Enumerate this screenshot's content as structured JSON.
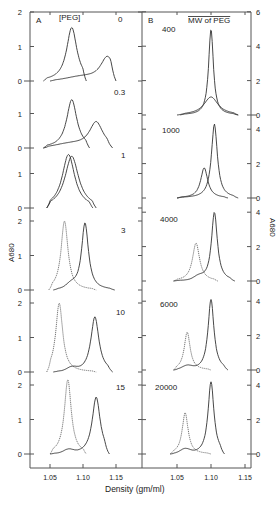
{
  "figure": {
    "xlabel": "Density (gm/ml)",
    "ylabel_left": "A680",
    "ylabel_right": "A680",
    "panel_A": {
      "letter": "A",
      "header": "[PEG]"
    },
    "panel_B": {
      "letter": "B",
      "header": "MW of PEG"
    }
  },
  "chart_data": [
    {
      "type": "line",
      "title": "A  [PEG]",
      "xlabel": "Density (gm/ml)",
      "ylabel": "A680",
      "x_ticks": [
        "1.05",
        "1.10",
        "1.15"
      ],
      "xlim": [
        1.02,
        1.17
      ],
      "subplots": [
        {
          "label": "0",
          "y_ticks": [
            "0",
            "1",
            "2"
          ],
          "ylim": [
            0,
            2
          ],
          "series": [
            {
              "name": "solid-1",
              "style": "solid",
              "peak_x": 1.083,
              "peak_y": 1.55,
              "width": 0.009,
              "x_range": [
                1.04,
                1.105
              ]
            },
            {
              "name": "solid-2",
              "style": "solid",
              "peak_x": 1.137,
              "peak_y": 0.7,
              "width": 0.012,
              "x_range": [
                1.05,
                1.15
              ],
              "shoulder": 0.1
            }
          ]
        },
        {
          "label": "0.3",
          "y_ticks": [
            "0",
            "1"
          ],
          "ylim": [
            0,
            1.9
          ],
          "series": [
            {
              "name": "solid-1",
              "style": "solid",
              "peak_x": 1.083,
              "peak_y": 1.4,
              "width": 0.009,
              "x_range": [
                1.04,
                1.11
              ]
            },
            {
              "name": "solid-2",
              "style": "solid",
              "peak_x": 1.12,
              "peak_y": 0.75,
              "width": 0.012,
              "x_range": [
                1.04,
                1.145
              ],
              "shoulder": 0.1
            }
          ]
        },
        {
          "label": "1",
          "y_ticks": [
            "0",
            "1"
          ],
          "ylim": [
            0,
            1.6
          ],
          "series": [
            {
              "name": "solid-1",
              "style": "solid",
              "peak_x": 1.078,
              "peak_y": 1.55,
              "width": 0.011,
              "x_range": [
                1.045,
                1.115
              ]
            },
            {
              "name": "solid-2",
              "style": "solid",
              "peak_x": 1.083,
              "peak_y": 1.5,
              "width": 0.012,
              "x_range": [
                1.045,
                1.12
              ]
            }
          ]
        },
        {
          "label": "3",
          "y_ticks": [
            "0",
            "1",
            "2"
          ],
          "ylim": [
            0,
            2
          ],
          "series": [
            {
              "name": "dotted",
              "style": "dotted",
              "peak_x": 1.072,
              "peak_y": 2.0,
              "width": 0.006,
              "x_range": [
                1.048,
                1.12
              ]
            },
            {
              "name": "solid",
              "style": "solid",
              "peak_x": 1.103,
              "peak_y": 1.95,
              "width": 0.006,
              "x_range": [
                1.055,
                1.148
              ],
              "bump_x": 1.082,
              "bump_y": 0.12
            }
          ]
        },
        {
          "label": "10",
          "y_ticks": [
            "0",
            "1",
            "2"
          ],
          "ylim": [
            0,
            2
          ],
          "series": [
            {
              "name": "dotted",
              "style": "dotted",
              "peak_x": 1.064,
              "peak_y": 2.0,
              "width": 0.006,
              "x_range": [
                1.045,
                1.12
              ]
            },
            {
              "name": "solid",
              "style": "solid",
              "peak_x": 1.118,
              "peak_y": 1.6,
              "width": 0.007,
              "x_range": [
                1.055,
                1.145
              ],
              "bump_x": 1.083,
              "bump_y": 0.1
            }
          ]
        },
        {
          "label": "15",
          "y_ticks": [
            "0",
            "1",
            "2"
          ],
          "ylim": [
            0,
            2
          ],
          "series": [
            {
              "name": "dotted",
              "style": "dotted",
              "peak_x": 1.077,
              "peak_y": 2.15,
              "width": 0.006,
              "x_range": [
                1.05,
                1.105
              ]
            },
            {
              "name": "solid",
              "style": "solid",
              "peak_x": 1.12,
              "peak_y": 1.65,
              "width": 0.007,
              "x_range": [
                1.05,
                1.14
              ],
              "bump_x": 1.078,
              "bump_y": 0.1
            }
          ]
        }
      ]
    },
    {
      "type": "line",
      "title": "B  MW of PEG",
      "xlabel": "Density (gm/ml)",
      "ylabel": "A680",
      "x_ticks": [
        "1.05",
        "1.10",
        "1.15"
      ],
      "xlim": [
        1.01,
        1.16
      ],
      "subplots": [
        {
          "label": "400",
          "y_ticks": [
            "0",
            "2",
            "4",
            "6"
          ],
          "ylim": [
            0,
            6
          ],
          "series": [
            {
              "name": "solid-1",
              "style": "solid",
              "peak_x": 1.1,
              "peak_y": 5.0,
              "width": 0.004,
              "x_range": [
                1.05,
                1.14
              ]
            },
            {
              "name": "solid-2",
              "style": "solid",
              "peak_x": 1.1,
              "peak_y": 1.05,
              "width": 0.012,
              "x_range": [
                1.055,
                1.14
              ]
            }
          ]
        },
        {
          "label": "1000",
          "y_ticks": [
            "0",
            "2",
            "4"
          ],
          "ylim": [
            0,
            4.5
          ],
          "series": [
            {
              "name": "solid-1",
              "style": "solid",
              "peak_x": 1.105,
              "peak_y": 4.3,
              "width": 0.005,
              "x_range": [
                1.05,
                1.14
              ]
            },
            {
              "name": "solid-2",
              "style": "solid",
              "peak_x": 1.09,
              "peak_y": 1.75,
              "width": 0.006,
              "x_range": [
                1.05,
                1.125
              ]
            }
          ]
        },
        {
          "label": "4000",
          "y_ticks": [
            "0",
            "2",
            "4"
          ],
          "ylim": [
            0,
            4.5
          ],
          "series": [
            {
              "name": "dotted",
              "style": "dotted",
              "peak_x": 1.078,
              "peak_y": 2.2,
              "width": 0.006,
              "x_range": [
                1.045,
                1.11
              ]
            },
            {
              "name": "solid",
              "style": "solid",
              "peak_x": 1.105,
              "peak_y": 4.0,
              "width": 0.005,
              "x_range": [
                1.045,
                1.135
              ],
              "bump_x": 1.082,
              "bump_y": 0.2
            }
          ]
        },
        {
          "label": "6000",
          "y_ticks": [
            "0",
            "2",
            "4"
          ],
          "ylim": [
            0,
            4.5
          ],
          "series": [
            {
              "name": "dotted",
              "style": "dotted",
              "peak_x": 1.065,
              "peak_y": 2.2,
              "width": 0.005,
              "x_range": [
                1.045,
                1.1
              ]
            },
            {
              "name": "solid",
              "style": "solid",
              "peak_x": 1.1,
              "peak_y": 4.1,
              "width": 0.005,
              "x_range": [
                1.045,
                1.125
              ],
              "bump_x": 1.065,
              "bump_y": 0.2
            }
          ]
        },
        {
          "label": "20000",
          "y_ticks": [
            "0",
            "2",
            "4"
          ],
          "ylim": [
            0,
            4.5
          ],
          "series": [
            {
              "name": "dotted",
              "style": "dotted",
              "peak_x": 1.062,
              "peak_y": 2.4,
              "width": 0.005,
              "x_range": [
                1.04,
                1.1
              ]
            },
            {
              "name": "solid",
              "style": "solid",
              "peak_x": 1.1,
              "peak_y": 4.2,
              "width": 0.005,
              "x_range": [
                1.04,
                1.12
              ],
              "bump_x": 1.062,
              "bump_y": 0.25
            }
          ]
        }
      ]
    }
  ],
  "layout": {
    "A": {
      "x_left": 30,
      "x_right": 142,
      "px_per_005": 33,
      "x105": 50,
      "panels": [
        {
          "base": 81,
          "ppu": 34.5,
          "label_x": 118,
          "label_y": 22
        },
        {
          "base": 148,
          "ppu": 34.5,
          "label_x": 114,
          "label_y": 95
        },
        {
          "base": 208,
          "ppu": 34.5,
          "label_x": 121,
          "label_y": 158
        },
        {
          "base": 290,
          "ppu": 34.5,
          "label_x": 121,
          "label_y": 233
        },
        {
          "base": 372,
          "ppu": 34.5,
          "label_x": 116,
          "label_y": 315
        },
        {
          "base": 454,
          "ppu": 34.5,
          "label_x": 116,
          "label_y": 390
        }
      ]
    },
    "B": {
      "x_left": 142,
      "x_right": 251,
      "px_per_005": 34,
      "x105": 177,
      "panels": [
        {
          "base": 115,
          "ppu": 17.2,
          "label_x": 162,
          "label_y": 32
        },
        {
          "base": 198,
          "ppu": 17.2,
          "label_x": 162,
          "label_y": 133
        },
        {
          "base": 281,
          "ppu": 17.2,
          "label_x": 160,
          "label_y": 222
        },
        {
          "base": 370,
          "ppu": 17.2,
          "label_x": 160,
          "label_y": 307
        },
        {
          "base": 454,
          "ppu": 17.2,
          "label_x": 155,
          "label_y": 390
        }
      ]
    }
  }
}
